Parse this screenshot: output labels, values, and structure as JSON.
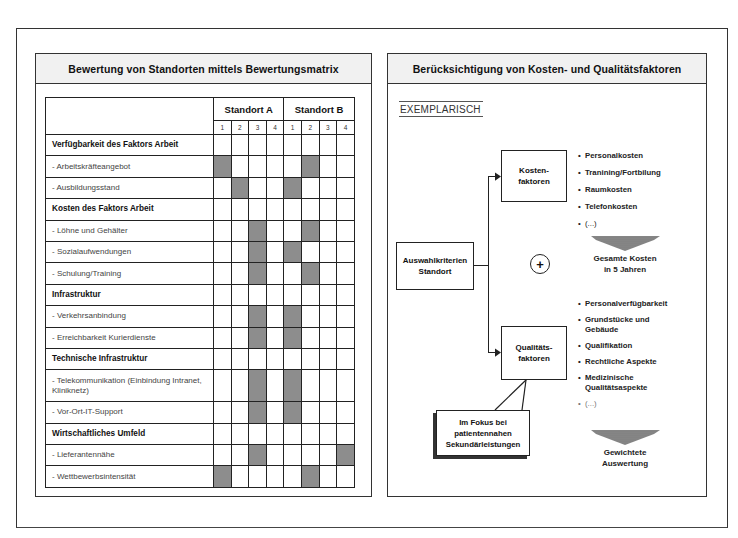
{
  "left_panel": {
    "title": "Bewertung von Standorten mittels Bewertungsmatrix",
    "matrix": {
      "groups": [
        "Standort A",
        "Standort B"
      ],
      "scale": [
        "1",
        "2",
        "3",
        "4"
      ],
      "rows": [
        {
          "label": "Verfügbarkeit des Faktors Arbeit",
          "type": "category",
          "a": null,
          "b": null
        },
        {
          "label": "- Arbeitskräfteangebot",
          "type": "item",
          "a": 1,
          "b": 2
        },
        {
          "label": "- Ausbildungsstand",
          "type": "item",
          "a": 2,
          "b": 1
        },
        {
          "label": "Kosten des Faktors Arbeit",
          "type": "category",
          "a": null,
          "b": null
        },
        {
          "label": "- Löhne und Gehälter",
          "type": "item",
          "a": 3,
          "b": 2
        },
        {
          "label": "- Sozialaufwendungen",
          "type": "item",
          "a": 3,
          "b": 1
        },
        {
          "label": "- Schulung/Training",
          "type": "item",
          "a": 3,
          "b": 2
        },
        {
          "label": "Infrastruktur",
          "type": "category",
          "a": null,
          "b": null
        },
        {
          "label": "- Verkehrsanbindung",
          "type": "item",
          "a": 3,
          "b": 1
        },
        {
          "label": "- Erreichbarkeit Kurierdienste",
          "type": "item",
          "a": 3,
          "b": 1
        },
        {
          "label": "Technische Infrastruktur",
          "type": "category",
          "a": null,
          "b": null
        },
        {
          "label": "- Telekommunikation (Einbindung Intranet, Kliniknetz)",
          "type": "item",
          "a": 3,
          "b": 1
        },
        {
          "label": "- Vor-Ort-IT-Support",
          "type": "item",
          "a": 3,
          "b": 1
        },
        {
          "label": "Wirtschaftliches Umfeld",
          "type": "category",
          "a": null,
          "b": null
        },
        {
          "label": "- Lieferantennähe",
          "type": "item",
          "a": 3,
          "b": 4
        },
        {
          "label": "- Wettbewerbsintensität",
          "type": "item",
          "a": 1,
          "b": 2
        }
      ]
    }
  },
  "right_panel": {
    "title": "Berücksichtigung von Kosten- und Qualitätsfaktoren",
    "tag": "EXEMPLARISCH",
    "root_box": {
      "line1": "Auswahlkriterien",
      "line2": "Standort"
    },
    "plus_symbol": "+",
    "cost_box": {
      "line1": "Kosten-",
      "line2": "faktoren"
    },
    "cost_items": [
      "Personalkosten",
      "Tranining/Fortbilung",
      "Raumkosten",
      "Telefonkosten",
      "(...)"
    ],
    "cost_result": {
      "line1": "Gesamte Kosten",
      "line2": "in 5 Jahren"
    },
    "quality_box": {
      "line1": "Qualitäts-",
      "line2": "faktoren"
    },
    "quality_items": [
      "Personalverfügbarkeit",
      "Grundstücke und Gebäude",
      "Qualifikation",
      "Rechtliche Aspekte",
      "Medizinische Qualitätsaspekte",
      "(...)"
    ],
    "quality_result": {
      "line1": "Gewichtete",
      "line2": "Auswertung"
    },
    "callout": {
      "line1": "Im Fokus bei",
      "line2": "patientennahen",
      "line3": "Sekundärleistungen"
    }
  },
  "colors": {
    "rating_fill": "#8d8d8d",
    "header_bg": "#f1f1f1",
    "border": "#222222"
  }
}
